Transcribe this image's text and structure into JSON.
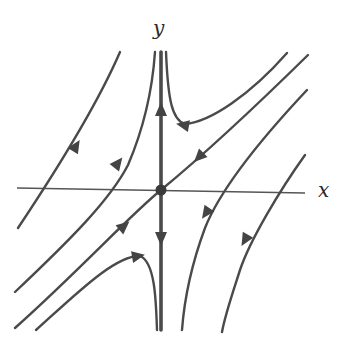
{
  "diagram": {
    "title": "",
    "type": "phase-portrait-saddle",
    "axes": {
      "x_label": "x",
      "y_label": "y"
    },
    "equilibrium": {
      "kind": "saddle",
      "position": "origin"
    },
    "colors": {
      "trajectory": "#4a4a4a",
      "axis": "#555555",
      "background": "#ffffff"
    },
    "separatrices": [
      {
        "name": "unstable-manifold",
        "direction": "vertical",
        "flow": "away-from-origin"
      },
      {
        "name": "stable-manifold",
        "direction": "diagonal",
        "flow": "toward-origin"
      }
    ],
    "trajectory_count": 10
  }
}
